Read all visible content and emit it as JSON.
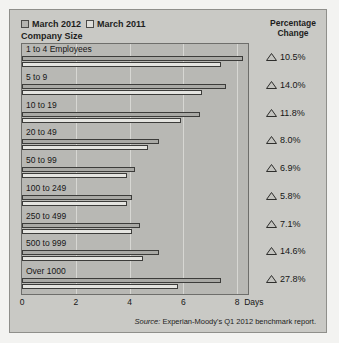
{
  "legend": {
    "items": [
      {
        "label": "March 2012",
        "color": "#b4b4b0"
      },
      {
        "label": "March 2011",
        "color": "#dededa"
      }
    ]
  },
  "headers": {
    "company_size": "Company Size",
    "percentage_line1": "Percentage",
    "percentage_line2": "Change"
  },
  "source": {
    "prefix": "Source:",
    "text": "Experian-Moody's Q1 2012 benchmark report."
  },
  "axis": {
    "ticks": [
      "0",
      "2",
      "4",
      "6",
      "8"
    ],
    "unit": "Days"
  },
  "chart_data": {
    "type": "bar",
    "orientation": "horizontal",
    "title": "",
    "xlabel": "Days",
    "ylabel": "Company Size",
    "xlim": [
      0,
      8.4
    ],
    "grid": true,
    "legend_position": "top-left",
    "categories": [
      "1 to 4 Employees",
      "5 to 9",
      "10 to 19",
      "20 to 49",
      "50 to 99",
      "100 to 249",
      "250 to 499",
      "500 to 999",
      "Over 1000"
    ],
    "series": [
      {
        "name": "March 2012",
        "color": "#a9a9a5",
        "values": [
          8.2,
          7.6,
          6.6,
          5.1,
          4.2,
          4.1,
          4.4,
          5.1,
          7.4
        ]
      },
      {
        "name": "March 2011",
        "color": "#e4e4e0",
        "values": [
          7.4,
          6.7,
          5.9,
          4.7,
          3.9,
          3.9,
          4.1,
          4.5,
          5.8
        ]
      }
    ],
    "percentage_change": [
      "10.5%",
      "14.0%",
      "11.8%",
      "8.0%",
      "6.9%",
      "5.8%",
      "7.1%",
      "14.6%",
      "27.8%"
    ],
    "percentage_direction": [
      "up",
      "up",
      "up",
      "up",
      "up",
      "up",
      "up",
      "up",
      "up"
    ]
  }
}
